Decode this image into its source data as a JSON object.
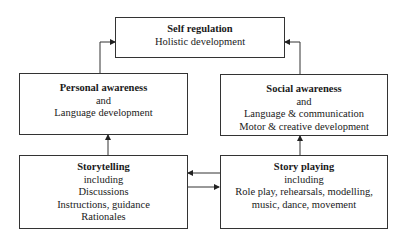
{
  "diagram": {
    "nodes": {
      "self_regulation": {
        "title": "Self regulation",
        "lines": [
          "Holistic development"
        ]
      },
      "personal_awareness": {
        "title": "Personal awareness",
        "lines": [
          "and",
          "Language development"
        ]
      },
      "social_awareness": {
        "title": "Social awareness",
        "lines": [
          "and",
          "Language & communication",
          "Motor & creative development"
        ]
      },
      "storytelling": {
        "title": "Storytelling",
        "lines": [
          "including",
          "Discussions",
          "Instructions, guidance",
          "Rationales"
        ]
      },
      "story_playing": {
        "title": "Story playing",
        "lines": [
          "including",
          "Role play, rehearsals, modelling,",
          "music, dance, movement"
        ]
      }
    },
    "edges": [
      {
        "from": "personal_awareness",
        "to": "self_regulation"
      },
      {
        "from": "social_awareness",
        "to": "self_regulation"
      },
      {
        "from": "storytelling",
        "to": "personal_awareness"
      },
      {
        "from": "story_playing",
        "to": "social_awareness"
      },
      {
        "from": "story_playing",
        "to": "storytelling"
      },
      {
        "from": "storytelling",
        "to": "story_playing"
      }
    ]
  }
}
